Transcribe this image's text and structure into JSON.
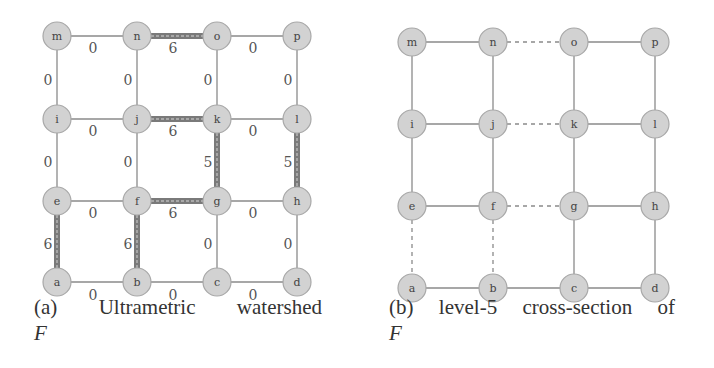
{
  "figure": {
    "panel_a": {
      "caption_label": "(a)",
      "caption_words": [
        "Ultrametric",
        "watershed"
      ],
      "caption_var": "F",
      "nodes": [
        {
          "id": "m",
          "x": 57,
          "y": 36
        },
        {
          "id": "n",
          "x": 137,
          "y": 36
        },
        {
          "id": "o",
          "x": 217,
          "y": 36
        },
        {
          "id": "p",
          "x": 297,
          "y": 36
        },
        {
          "id": "i",
          "x": 57,
          "y": 119
        },
        {
          "id": "j",
          "x": 137,
          "y": 119
        },
        {
          "id": "k",
          "x": 217,
          "y": 119
        },
        {
          "id": "l",
          "x": 297,
          "y": 119
        },
        {
          "id": "e",
          "x": 57,
          "y": 201
        },
        {
          "id": "f",
          "x": 137,
          "y": 201
        },
        {
          "id": "g",
          "x": 217,
          "y": 201
        },
        {
          "id": "h",
          "x": 297,
          "y": 201
        },
        {
          "id": "a",
          "x": 57,
          "y": 282
        },
        {
          "id": "b",
          "x": 137,
          "y": 282
        },
        {
          "id": "c",
          "x": 217,
          "y": 282
        },
        {
          "id": "d",
          "x": 297,
          "y": 282
        }
      ],
      "edges": [
        {
          "from": "m",
          "to": "n",
          "weight": "0"
        },
        {
          "from": "n",
          "to": "o",
          "weight": "6"
        },
        {
          "from": "o",
          "to": "p",
          "weight": "0"
        },
        {
          "from": "i",
          "to": "j",
          "weight": "0"
        },
        {
          "from": "j",
          "to": "k",
          "weight": "6"
        },
        {
          "from": "k",
          "to": "l",
          "weight": "0"
        },
        {
          "from": "e",
          "to": "f",
          "weight": "0"
        },
        {
          "from": "f",
          "to": "g",
          "weight": "6"
        },
        {
          "from": "g",
          "to": "h",
          "weight": "0"
        },
        {
          "from": "a",
          "to": "b",
          "weight": "0"
        },
        {
          "from": "b",
          "to": "c",
          "weight": "0"
        },
        {
          "from": "c",
          "to": "d",
          "weight": "0"
        },
        {
          "from": "m",
          "to": "i",
          "weight": "0"
        },
        {
          "from": "n",
          "to": "j",
          "weight": "0"
        },
        {
          "from": "o",
          "to": "k",
          "weight": "0"
        },
        {
          "from": "p",
          "to": "l",
          "weight": "0"
        },
        {
          "from": "i",
          "to": "e",
          "weight": "0"
        },
        {
          "from": "j",
          "to": "f",
          "weight": "0"
        },
        {
          "from": "k",
          "to": "g",
          "weight": "5"
        },
        {
          "from": "l",
          "to": "h",
          "weight": "5"
        },
        {
          "from": "e",
          "to": "a",
          "weight": "6"
        },
        {
          "from": "f",
          "to": "b",
          "weight": "6"
        },
        {
          "from": "g",
          "to": "c",
          "weight": "0"
        },
        {
          "from": "h",
          "to": "d",
          "weight": "0"
        }
      ]
    },
    "panel_b": {
      "caption_label": "(b)",
      "caption_words": [
        "level-5",
        "cross-section",
        "of"
      ],
      "caption_var": "F",
      "nodes": [
        {
          "id": "m",
          "x": 412,
          "y": 42
        },
        {
          "id": "n",
          "x": 493,
          "y": 42
        },
        {
          "id": "o",
          "x": 574,
          "y": 42
        },
        {
          "id": "p",
          "x": 655,
          "y": 42
        },
        {
          "id": "i",
          "x": 412,
          "y": 124
        },
        {
          "id": "j",
          "x": 493,
          "y": 124
        },
        {
          "id": "k",
          "x": 574,
          "y": 124
        },
        {
          "id": "l",
          "x": 655,
          "y": 124
        },
        {
          "id": "e",
          "x": 412,
          "y": 206
        },
        {
          "id": "f",
          "x": 493,
          "y": 206
        },
        {
          "id": "g",
          "x": 574,
          "y": 206
        },
        {
          "id": "h",
          "x": 655,
          "y": 206
        },
        {
          "id": "a",
          "x": 412,
          "y": 288
        },
        {
          "id": "b",
          "x": 493,
          "y": 288
        },
        {
          "id": "c",
          "x": 574,
          "y": 288
        },
        {
          "id": "d",
          "x": 655,
          "y": 288
        }
      ],
      "edges": [
        {
          "from": "m",
          "to": "n",
          "style": "solid"
        },
        {
          "from": "n",
          "to": "o",
          "style": "dashed"
        },
        {
          "from": "o",
          "to": "p",
          "style": "solid"
        },
        {
          "from": "i",
          "to": "j",
          "style": "solid"
        },
        {
          "from": "j",
          "to": "k",
          "style": "dashed"
        },
        {
          "from": "k",
          "to": "l",
          "style": "solid"
        },
        {
          "from": "e",
          "to": "f",
          "style": "solid"
        },
        {
          "from": "f",
          "to": "g",
          "style": "dashed"
        },
        {
          "from": "g",
          "to": "h",
          "style": "solid"
        },
        {
          "from": "a",
          "to": "b",
          "style": "solid"
        },
        {
          "from": "b",
          "to": "c",
          "style": "solid"
        },
        {
          "from": "c",
          "to": "d",
          "style": "solid"
        },
        {
          "from": "m",
          "to": "i",
          "style": "solid"
        },
        {
          "from": "n",
          "to": "j",
          "style": "solid"
        },
        {
          "from": "o",
          "to": "k",
          "style": "solid"
        },
        {
          "from": "p",
          "to": "l",
          "style": "solid"
        },
        {
          "from": "i",
          "to": "e",
          "style": "solid"
        },
        {
          "from": "j",
          "to": "f",
          "style": "solid"
        },
        {
          "from": "k",
          "to": "g",
          "style": "solid"
        },
        {
          "from": "l",
          "to": "h",
          "style": "solid"
        },
        {
          "from": "e",
          "to": "a",
          "style": "dashed"
        },
        {
          "from": "f",
          "to": "b",
          "style": "dashed"
        },
        {
          "from": "g",
          "to": "c",
          "style": "solid"
        },
        {
          "from": "h",
          "to": "d",
          "style": "solid"
        }
      ]
    },
    "colors": {
      "node_fill": "#d2d2d2",
      "node_stroke": "#a8a8a8",
      "thin_edge": "#8a8a8a",
      "thick_edge": "#7a7a7a"
    },
    "thick_threshold": 5
  }
}
